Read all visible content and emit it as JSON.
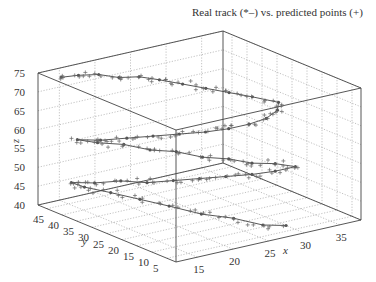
{
  "chart_data": {
    "type": "scatter",
    "subtype": "3d-line-and-scatter",
    "title": "Real track (*–) vs. predicted points (+)",
    "xlabel": "x",
    "ylabel": "y",
    "zlabel": "z",
    "xlim": [
      12,
      38
    ],
    "ylim": [
      2,
      48
    ],
    "zlim": [
      40,
      75
    ],
    "xticks": [
      15,
      20,
      25,
      30,
      35
    ],
    "yticks": [
      5,
      10,
      15,
      20,
      25,
      30,
      35,
      40,
      45
    ],
    "zticks": [
      40,
      45,
      50,
      55,
      60,
      65,
      70,
      75
    ],
    "grid": true,
    "legend": "none (described in title)",
    "series": [
      {
        "name": "Real track",
        "marker": "*",
        "line": "solid",
        "description": "Spiral descending track: starts near x=14,y=45,z=74, sweeps toward x=34,z=68, back through x~22 around z=60, then x~30 near z=55, down to z~46 at x~14,y~45 and ends near x~30,y~8,z~40",
        "points": [
          [
            14,
            45,
            74
          ],
          [
            16,
            44,
            74
          ],
          [
            18,
            42,
            74
          ],
          [
            20,
            40,
            73
          ],
          [
            22,
            38,
            73
          ],
          [
            24,
            36,
            72
          ],
          [
            26,
            33,
            71
          ],
          [
            28,
            30,
            70
          ],
          [
            30,
            27,
            69
          ],
          [
            32,
            24,
            68
          ],
          [
            34,
            20,
            67
          ],
          [
            33,
            18,
            66
          ],
          [
            31,
            17,
            65
          ],
          [
            29,
            18,
            64
          ],
          [
            27,
            20,
            63
          ],
          [
            25,
            23,
            62
          ],
          [
            23,
            27,
            61
          ],
          [
            21,
            31,
            60
          ],
          [
            19,
            35,
            59
          ],
          [
            17,
            39,
            58
          ],
          [
            15,
            42,
            58
          ],
          [
            17,
            40,
            57
          ],
          [
            19,
            36,
            57
          ],
          [
            21,
            32,
            56
          ],
          [
            23,
            28,
            56
          ],
          [
            25,
            24,
            55
          ],
          [
            27,
            20,
            55
          ],
          [
            29,
            17,
            54
          ],
          [
            31,
            14,
            54
          ],
          [
            33,
            12,
            53
          ],
          [
            31,
            14,
            52
          ],
          [
            29,
            17,
            51
          ],
          [
            27,
            21,
            50
          ],
          [
            25,
            25,
            49
          ],
          [
            23,
            29,
            48
          ],
          [
            21,
            33,
            47
          ],
          [
            19,
            37,
            47
          ],
          [
            17,
            41,
            46
          ],
          [
            15,
            44,
            46
          ],
          [
            16,
            42,
            45
          ],
          [
            18,
            38,
            44
          ],
          [
            20,
            33,
            43
          ],
          [
            22,
            28,
            42
          ],
          [
            24,
            22,
            41
          ],
          [
            26,
            16,
            41
          ],
          [
            28,
            11,
            40
          ],
          [
            30,
            8,
            40
          ]
        ]
      },
      {
        "name": "Predicted points",
        "marker": "+",
        "line": "none",
        "description": "Noisy predictions scattered closely around the real track"
      }
    ]
  }
}
